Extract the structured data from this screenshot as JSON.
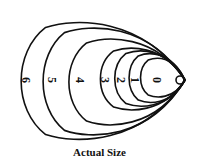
{
  "figure": {
    "caption": "Actual Size",
    "stroke_color": "#111111",
    "background": "#ffffff",
    "tip": {
      "x": 185,
      "y": 80
    },
    "innermost_circle": {
      "cx": 180,
      "cy": 80,
      "r": 4
    },
    "sizes": [
      {
        "label": "0",
        "left": 140,
        "top": 57,
        "bottom": 98,
        "label_x": 157
      },
      {
        "label": "1",
        "left": 128,
        "top": 52,
        "bottom": 104,
        "label_x": 135
      },
      {
        "label": "2",
        "left": 113,
        "top": 49,
        "bottom": 108,
        "label_x": 121
      },
      {
        "label": "3",
        "left": 98,
        "top": 46,
        "bottom": 112,
        "label_x": 105
      },
      {
        "label": "4",
        "left": 65,
        "top": 36,
        "bottom": 128,
        "label_x": 80
      },
      {
        "label": "5",
        "left": 38,
        "top": 24,
        "bottom": 139,
        "label_x": 52
      },
      {
        "label": "6",
        "left": 15,
        "top": 18,
        "bottom": 144,
        "label_x": 26
      }
    ]
  }
}
